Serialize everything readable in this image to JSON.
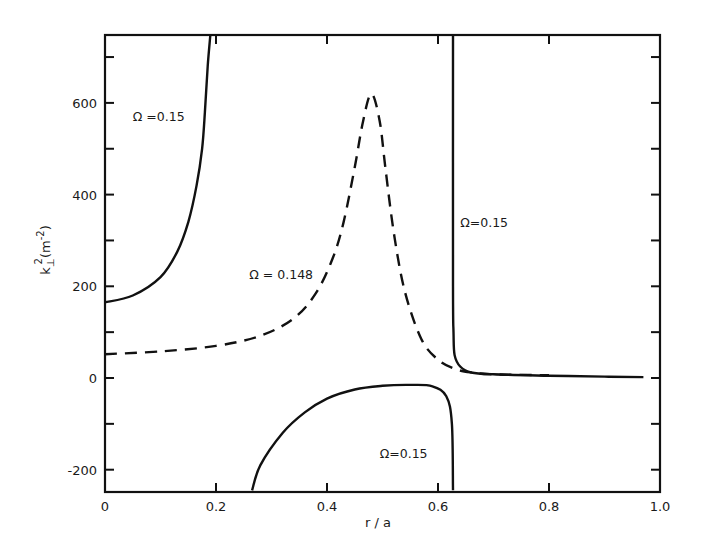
{
  "chart_data": {
    "type": "line",
    "title": "",
    "xlabel": "r / a",
    "ylabel": "k⊥² (m⁻²)",
    "ylabel_parts": {
      "base": "k",
      "sub": "⊥",
      "sup": "2",
      "unit": "(m",
      "unit_sup": "-2",
      "close": ")"
    },
    "xlim": [
      0,
      1.0
    ],
    "ylim": [
      -245,
      750
    ],
    "grid": false,
    "legend": "none (inline annotations)",
    "x_ticks": [
      {
        "value": 0,
        "label": "0"
      },
      {
        "value": 0.2,
        "label": "0.2"
      },
      {
        "value": 0.4,
        "label": "0.4"
      },
      {
        "value": 0.6,
        "label": "0.6"
      },
      {
        "value": 0.8,
        "label": "0.8"
      },
      {
        "value": 1.0,
        "label": "1.0"
      }
    ],
    "y_ticks": [
      {
        "value": -200,
        "label": "-200"
      },
      {
        "value": -100,
        "label": ""
      },
      {
        "value": 0,
        "label": "0"
      },
      {
        "value": 100,
        "label": ""
      },
      {
        "value": 200,
        "label": "200"
      },
      {
        "value": 300,
        "label": ""
      },
      {
        "value": 400,
        "label": "400"
      },
      {
        "value": 500,
        "label": ""
      },
      {
        "value": 600,
        "label": "600"
      },
      {
        "value": 700,
        "label": ""
      }
    ],
    "series": [
      {
        "name": "Ω = 0.15 (branch 1, left)",
        "style": "solid",
        "x": [
          0.0,
          0.05,
          0.1,
          0.13,
          0.15,
          0.165,
          0.175,
          0.18,
          0.185,
          0.19
        ],
        "y": [
          165,
          180,
          220,
          275,
          340,
          420,
          500,
          580,
          680,
          750
        ]
      },
      {
        "name": "Ω = 0.148",
        "style": "dashed",
        "x": [
          0.0,
          0.1,
          0.2,
          0.28,
          0.34,
          0.38,
          0.41,
          0.43,
          0.45,
          0.465,
          0.48,
          0.495,
          0.505,
          0.52,
          0.54,
          0.57,
          0.6,
          0.63,
          0.66,
          0.7,
          0.8
        ],
        "y": [
          52,
          58,
          70,
          92,
          130,
          185,
          260,
          340,
          460,
          560,
          620,
          560,
          460,
          320,
          190,
          85,
          40,
          20,
          12,
          8,
          6
        ]
      },
      {
        "name": "Ω = 0.15 (branch 2, right)",
        "style": "solid",
        "x": [
          0.627,
          0.627,
          0.628,
          0.63,
          0.64,
          0.66,
          0.7,
          0.8,
          0.9,
          0.97
        ],
        "y": [
          750,
          200,
          100,
          50,
          25,
          12,
          8,
          5,
          3,
          2
        ]
      },
      {
        "name": "Ω = 0.15 (branch 3, lower)",
        "style": "solid",
        "x": [
          0.265,
          0.28,
          0.32,
          0.36,
          0.4,
          0.45,
          0.5,
          0.55,
          0.59,
          0.615,
          0.625,
          0.627
        ],
        "y": [
          -245,
          -190,
          -120,
          -75,
          -45,
          -25,
          -17,
          -15,
          -18,
          -40,
          -100,
          -245
        ]
      }
    ],
    "annotations": [
      {
        "text": "Ω =0.15",
        "x": 0.05,
        "y": 560
      },
      {
        "text": "Ω = 0.148",
        "x": 0.26,
        "y": 215
      },
      {
        "text": "Ω=0.15",
        "x": 0.64,
        "y": 330
      },
      {
        "text": "Ω=0.15",
        "x": 0.495,
        "y": -175
      }
    ]
  }
}
